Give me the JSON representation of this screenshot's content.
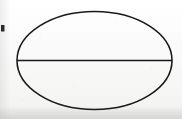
{
  "figure": {
    "title": "Ellipse bisected by its horizontal major axis",
    "medium": "hand-drawn ink on off-white paper (scanned)",
    "background_color": "#fbfbfa",
    "ink_color": "#1a1a1a",
    "canvas": {
      "width": 182,
      "height": 119
    },
    "shapes": {
      "ellipse": {
        "label": "ellipse-outline",
        "center_x": 94.5,
        "center_y": 60.5,
        "radius_x": 77.5,
        "radius_y": 49,
        "stroke_width": 1.6,
        "fill": "none"
      },
      "chord": {
        "label": "horizontal-major-axis-line",
        "x1": 17,
        "y1": 60.5,
        "x2": 172,
        "y2": 60.5,
        "stroke_width": 1.5
      },
      "edge_mark": {
        "label": "ink-mark-left-margin",
        "x": 1,
        "y": 25,
        "width": 3.5,
        "height": 6.5,
        "color": "#2a2a2a"
      }
    }
  }
}
